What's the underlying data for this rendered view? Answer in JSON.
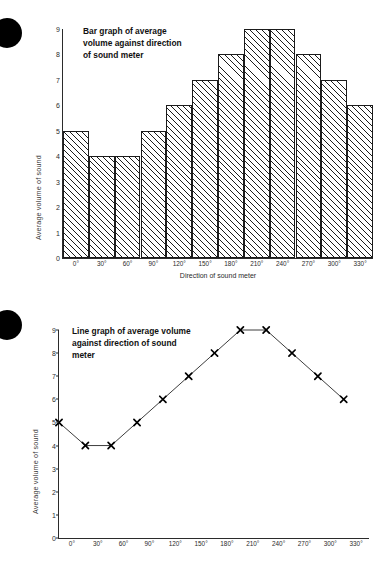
{
  "page": {
    "background": "#ffffff",
    "bullet_color": "#000000"
  },
  "figures": [
    {
      "id": "bar",
      "bullet_name": "bullet-marker",
      "title": "Bar graph of average\nvolume against direction\nof sound meter",
      "ylabel": "Average volume of sound",
      "xlabel": "Direction of sound meter",
      "yticks": [
        "0",
        "1",
        "2",
        "3",
        "4",
        "5",
        "6",
        "7",
        "8",
        "9"
      ],
      "xticks": [
        "0°",
        "30°",
        "60°",
        "90°",
        "120°",
        "150°",
        "180°",
        "210°",
        "240°",
        "270°",
        "300°",
        "330°"
      ]
    },
    {
      "id": "line",
      "bullet_name": "bullet-marker",
      "title": "Line graph of average volume\nagainst direction of sound\nmeter",
      "ylabel": "Average volume of sound",
      "xlabel": "",
      "yticks": [
        "0",
        "1",
        "2",
        "3",
        "4",
        "5",
        "6",
        "7",
        "8",
        "9"
      ],
      "xticks": [
        "0°",
        "30°",
        "60°",
        "90°",
        "120°",
        "150°",
        "180°",
        "210°",
        "240°",
        "270°",
        "300°",
        "330°"
      ]
    }
  ],
  "chart_data": [
    {
      "type": "bar",
      "title": "Bar graph of average volume against direction of sound meter",
      "categories": [
        "0°",
        "30°",
        "60°",
        "90°",
        "120°",
        "150°",
        "180°",
        "210°",
        "240°",
        "270°",
        "300°",
        "330°"
      ],
      "values": [
        5,
        4,
        4,
        5,
        6,
        7,
        8,
        9,
        9,
        8,
        7,
        6
      ],
      "xlabel": "Direction of sound meter",
      "ylabel": "Average volume of sound",
      "ylim": [
        0,
        9
      ],
      "yticks": [
        0,
        1,
        2,
        3,
        4,
        5,
        6,
        7,
        8,
        9
      ],
      "grid": false,
      "legend": false,
      "bar_fill": "diagonal-hatch",
      "bar_edge_color": "#1b1b1b"
    },
    {
      "type": "line",
      "title": "Line graph of average volume against direction of sound meter",
      "categories": [
        "0°",
        "30°",
        "60°",
        "90°",
        "120°",
        "150°",
        "180°",
        "210°",
        "240°",
        "270°",
        "300°",
        "330°"
      ],
      "values": [
        5,
        4,
        4,
        5,
        6,
        7,
        8,
        9,
        9,
        8,
        7,
        6
      ],
      "xlabel": "",
      "ylabel": "Average volume of sound",
      "ylim": [
        0,
        9
      ],
      "yticks": [
        0,
        1,
        2,
        3,
        4,
        5,
        6,
        7,
        8,
        9
      ],
      "grid": false,
      "legend": false,
      "marker": "x",
      "line_color": "#3d3d3d",
      "marker_color": "#000000"
    }
  ]
}
